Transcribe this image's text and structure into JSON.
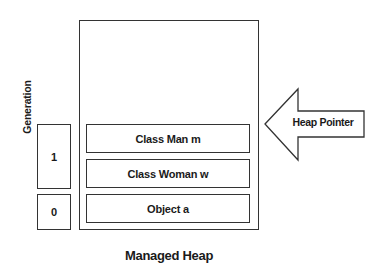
{
  "diagram": {
    "title": "Managed Heap",
    "generation_axis_label": "Generation",
    "generations": [
      {
        "label": "1"
      },
      {
        "label": "0"
      }
    ],
    "heap_objects": [
      {
        "label": "Class Man m"
      },
      {
        "label": "Class Woman w"
      },
      {
        "label": "Object a"
      }
    ],
    "pointer": {
      "label": "Heap Pointer",
      "direction": "left"
    },
    "colors": {
      "stroke": "#333333",
      "fill": "#ffffff",
      "text": "#1a1a1a"
    }
  }
}
